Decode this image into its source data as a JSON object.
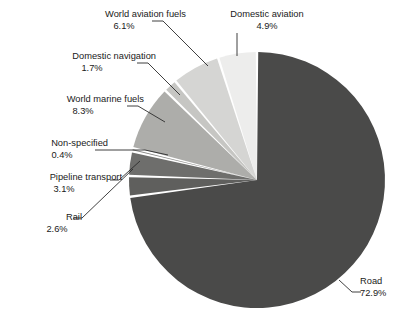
{
  "chart_data": {
    "type": "pie",
    "title": "",
    "subtitle": "",
    "xlabel": "",
    "ylabel": "",
    "legend_position": "none",
    "grid": false,
    "units": "percent",
    "start_angle_deg": 90,
    "direction": "counterclockwise",
    "categories": [
      "Domestic aviation",
      "World aviation fuels",
      "Domestic navigation",
      "World marine fuels",
      "Non-specified",
      "Pipeline transport",
      "Rail",
      "Road"
    ],
    "values": [
      4.9,
      6.1,
      1.7,
      8.3,
      0.4,
      3.1,
      2.6,
      72.9
    ],
    "slices": [
      {
        "label": "Domestic aviation",
        "value": 4.9,
        "value_text": "4.9%",
        "color": "#ededec",
        "label_id": "lbl-domestic-aviation"
      },
      {
        "label": "World aviation fuels",
        "value": 6.1,
        "value_text": "6.1%",
        "color": "#d5d5d3",
        "label_id": "lbl-world-aviation-fuels"
      },
      {
        "label": "Domestic navigation",
        "value": 1.7,
        "value_text": "1.7%",
        "color": "#c6c6c3",
        "label_id": "lbl-domestic-navigation"
      },
      {
        "label": "World marine fuels",
        "value": 8.3,
        "value_text": "8.3%",
        "color": "#adadaa",
        "label_id": "lbl-world-marine-fuels"
      },
      {
        "label": "Non-specified",
        "value": 0.4,
        "value_text": "0.4%",
        "color": "#8a8a88",
        "label_id": "lbl-non-specified"
      },
      {
        "label": "Pipeline transport",
        "value": 3.1,
        "value_text": "3.1%",
        "color": "#6e6e6c",
        "label_id": "lbl-pipeline-transport"
      },
      {
        "label": "Rail",
        "value": 2.6,
        "value_text": "2.6%",
        "color": "#5f5f5d",
        "label_id": "lbl-rail"
      },
      {
        "label": "Road",
        "value": 72.9,
        "value_text": "72.9%",
        "color": "#4a4a49",
        "label_id": "lbl-road"
      }
    ]
  },
  "labels": {
    "world_aviation_fuels": {
      "name": "World aviation fuels",
      "pct": "6.1%"
    },
    "domestic_aviation": {
      "name": "Domestic aviation",
      "pct": "4.9%"
    },
    "domestic_navigation": {
      "name": "Domestic navigation",
      "pct": "1.7%"
    },
    "world_marine_fuels": {
      "name": "World marine fuels",
      "pct": "8.3%"
    },
    "non_specified": {
      "name": "Non-specified",
      "pct": "0.4%"
    },
    "pipeline_transport": {
      "name": "Pipeline transport",
      "pct": "3.1%"
    },
    "rail": {
      "name": "Rail",
      "pct": "2.6%"
    },
    "road": {
      "name": "Road",
      "pct": "72.9%"
    }
  },
  "style": {
    "background": "#ffffff",
    "text_color": "#1a1a1a",
    "leader_line_color": "#2b2b2b",
    "slice_gap_color": "#ffffff"
  },
  "geometry": {
    "center_x": 257,
    "center_y": 180,
    "radius": 128
  }
}
